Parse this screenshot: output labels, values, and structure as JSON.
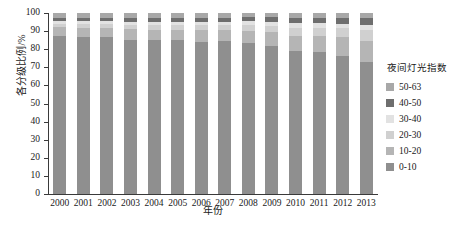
{
  "chart_data": {
    "type": "bar",
    "stacked": true,
    "title": "",
    "xlabel": "年份",
    "ylabel": "各分级比例/%",
    "ylim": [
      0,
      100
    ],
    "yticks": [
      0,
      10,
      20,
      30,
      40,
      50,
      60,
      70,
      80,
      90,
      100
    ],
    "grid": false,
    "legend_position": "right",
    "legend_title": "夜间灯光指数",
    "categories": [
      "2000",
      "2001",
      "2002",
      "2003",
      "2004",
      "2005",
      "2006",
      "2007",
      "2008",
      "2009",
      "2010",
      "2011",
      "2012",
      "2013"
    ],
    "series": [
      {
        "name": "0-10",
        "color": "#8f8f8f",
        "values": [
          87.5,
          86.5,
          86.5,
          85.0,
          85.0,
          85.0,
          84.0,
          84.5,
          83.5,
          82.0,
          79.0,
          78.5,
          76.5,
          73.0
        ]
      },
      {
        "name": "10-20",
        "color": "#b5b5b5",
        "values": [
          4.5,
          5.0,
          5.0,
          6.0,
          5.5,
          5.5,
          6.5,
          6.0,
          6.5,
          7.5,
          8.5,
          9.0,
          10.0,
          11.5
        ]
      },
      {
        "name": "20-30",
        "color": "#d0d0d0",
        "values": [
          2.0,
          2.5,
          2.5,
          2.5,
          3.0,
          3.0,
          3.0,
          3.0,
          3.5,
          3.5,
          4.5,
          4.5,
          5.0,
          6.0
        ]
      },
      {
        "name": "30-40",
        "color": "#e2e2e2",
        "values": [
          1.5,
          1.5,
          1.5,
          1.5,
          1.5,
          1.5,
          1.5,
          1.5,
          2.0,
          2.0,
          2.5,
          2.5,
          2.5,
          3.0
        ]
      },
      {
        "name": "40-50",
        "color": "#6e6e6e",
        "values": [
          2.0,
          2.0,
          2.0,
          2.5,
          2.5,
          2.5,
          2.5,
          2.5,
          2.5,
          3.0,
          3.0,
          3.0,
          3.0,
          3.5
        ]
      },
      {
        "name": "50-63",
        "color": "#a8a8a8",
        "values": [
          2.5,
          2.5,
          2.5,
          2.5,
          2.5,
          2.5,
          2.5,
          2.5,
          2.0,
          2.0,
          2.5,
          2.5,
          3.0,
          3.0
        ]
      }
    ],
    "legend_entries": [
      {
        "label": "50-63",
        "color": "#a8a8a8"
      },
      {
        "label": "40-50",
        "color": "#6e6e6e"
      },
      {
        "label": "30-40",
        "color": "#e2e2e2"
      },
      {
        "label": "20-30",
        "color": "#d0d0d0"
      },
      {
        "label": "10-20",
        "color": "#b5b5b5"
      },
      {
        "label": "0-10",
        "color": "#8f8f8f"
      }
    ]
  }
}
